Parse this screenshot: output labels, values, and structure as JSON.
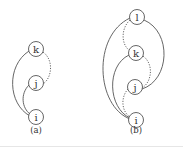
{
  "colors": {
    "stroke": "#555555",
    "node_fill": "#ffffff",
    "text": "#333333",
    "background": "#ffffff"
  },
  "diagrams": [
    {
      "caption": "(a)",
      "caption_pos": [
        36,
        133
      ],
      "nodes": [
        {
          "id": "k",
          "label": "k",
          "x": 36,
          "y": 49
        },
        {
          "id": "j",
          "label": "j",
          "x": 36,
          "y": 83
        },
        {
          "id": "i",
          "label": "i",
          "x": 36,
          "y": 117
        }
      ],
      "edges": [
        {
          "from": "k",
          "to": "j",
          "style": "dotted",
          "side": "right",
          "d": "M43,52 C54,60 52,78 43,84"
        },
        {
          "from": "j",
          "to": "i",
          "style": "solid",
          "side": "left",
          "d": "M29,85 C20,94 22,108 30,114"
        },
        {
          "from": "k",
          "to": "i",
          "style": "solid",
          "side": "left",
          "d": "M29,51 C6,66 8,104 30,116"
        }
      ]
    },
    {
      "caption": "(b)",
      "caption_pos": [
        136,
        133
      ],
      "nodes": [
        {
          "id": "l",
          "label": "l",
          "x": 137,
          "y": 17
        },
        {
          "id": "k",
          "label": "k",
          "x": 136,
          "y": 53
        },
        {
          "id": "j",
          "label": "j",
          "x": 135,
          "y": 87
        },
        {
          "id": "i",
          "label": "i",
          "x": 136,
          "y": 120
        }
      ],
      "edges": [
        {
          "from": "l",
          "to": "k",
          "style": "dotted",
          "side": "left",
          "d": "M130,20 C121,28 121,44 129,50"
        },
        {
          "from": "l",
          "to": "j",
          "style": "solid",
          "side": "right",
          "d": "M144,20 C172,32 170,80 142,89"
        },
        {
          "from": "l",
          "to": "i",
          "style": "solid",
          "side": "left",
          "d": "M130,18 C92,36 96,106 130,119"
        },
        {
          "from": "k",
          "to": "j",
          "style": "dotted",
          "side": "right",
          "d": "M143,56 C154,64 152,82 142,88"
        },
        {
          "from": "k",
          "to": "i",
          "style": "solid",
          "side": "left",
          "d": "M129,55 C106,66 108,108 130,118"
        },
        {
          "from": "j",
          "to": "i",
          "style": "dotted",
          "side": "left",
          "d": "M128,89 C120,98 122,112 130,117"
        }
      ]
    }
  ],
  "node_radius": 7.5
}
